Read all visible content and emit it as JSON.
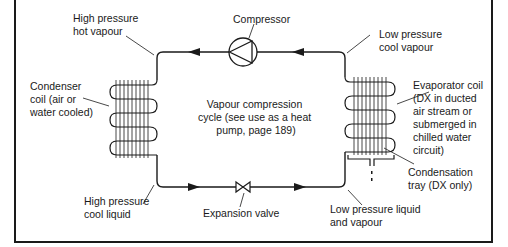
{
  "diagram": {
    "title": "Vapour compression cycle",
    "center_text": [
      "Vapour compression",
      "cycle (see use as a heat",
      "pump, page 189)"
    ],
    "components": {
      "compressor": {
        "label": [
          "Compressor"
        ]
      },
      "expansion_valve": {
        "label": [
          "Expansion valve"
        ]
      },
      "condenser": {
        "label": [
          "Condenser",
          "coil (air or",
          "water cooled)"
        ]
      },
      "evaporator": {
        "label": [
          "Evaporator coil",
          "(DX in ducted",
          "air stream or",
          "submerged in",
          "chilled water",
          "circuit)"
        ]
      },
      "condensation_tray": {
        "label": [
          "Condensation",
          "tray (DX only)"
        ]
      }
    },
    "states": {
      "hp_hot_vapour": [
        "High pressure",
        "hot vapour"
      ],
      "lp_cool_vapour": [
        "Low pressure",
        "cool vapour"
      ],
      "hp_cool_liquid": [
        "High pressure",
        "cool liquid"
      ],
      "lp_liquid_vapour": [
        "Low pressure liquid",
        "and vapour"
      ]
    },
    "colors": {
      "line": "#1a1a1a",
      "background": "#ffffff"
    }
  }
}
